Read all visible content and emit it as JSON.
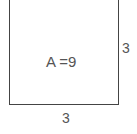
{
  "diagram": {
    "shape": "square",
    "area_label": "A =9",
    "side_right_label": "3",
    "side_bottom_label": "3",
    "stroke_color": "#444444"
  }
}
